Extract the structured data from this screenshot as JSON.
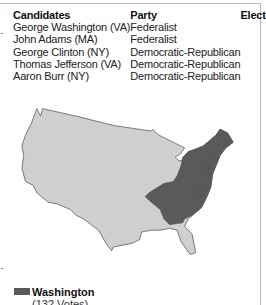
{
  "table": {
    "headers": {
      "candidates": "Candidates",
      "party": "Party",
      "electoral_vote": "Electoral Vote"
    },
    "rows": [
      {
        "candidate": "George Washington (VA)",
        "party": "Federalist",
        "votes": "132"
      },
      {
        "candidate": "John Adams (MA)",
        "party": "Federalist",
        "votes": "77"
      },
      {
        "candidate": "George Clinton (NY)",
        "party": "Democratic-Republican",
        "votes": "50"
      },
      {
        "candidate": "Thomas Jefferson (VA)",
        "party": "Democratic-Republican",
        "votes": "4"
      },
      {
        "candidate": "Aaron Burr (NY)",
        "party": "Democratic-Republican",
        "votes": "1"
      }
    ]
  },
  "map": {
    "label": "United States map with states won shaded",
    "colors": {
      "won": "#5a5a5a",
      "other": "#cfcfcf",
      "outline": "#555555"
    },
    "states_won": [
      "NH",
      "MA",
      "CT",
      "NY",
      "NJ",
      "PA",
      "DE",
      "MD",
      "VA",
      "KY",
      "NC",
      "SC",
      "GA"
    ]
  },
  "legend": {
    "name": "Washington",
    "votes": "(132 Votes)",
    "color": "#5a5a5a"
  }
}
